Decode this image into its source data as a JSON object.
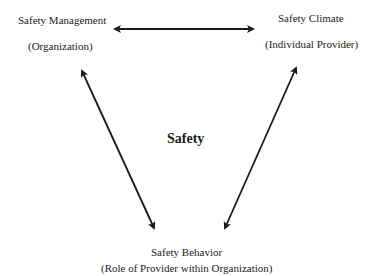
{
  "diagram": {
    "center_label": "Safety",
    "nodes": {
      "management": {
        "title": "Safety Management",
        "subtitle": "(Organization)"
      },
      "climate": {
        "title": "Safety Climate",
        "subtitle": "(Individual Provider)"
      },
      "behavior": {
        "title": "Safety Behavior",
        "subtitle": "(Role of Provider within Organization)"
      }
    },
    "edges": [
      {
        "from": "Safety Management",
        "to": "Safety Climate",
        "type": "bidirectional"
      },
      {
        "from": "Safety Management",
        "to": "Safety Behavior",
        "type": "bidirectional"
      },
      {
        "from": "Safety Climate",
        "to": "Safety Behavior",
        "type": "bidirectional"
      }
    ],
    "colors": {
      "arrow": "#1a1a1a",
      "text": "#1a1a1a",
      "background": "#ffffff"
    }
  }
}
